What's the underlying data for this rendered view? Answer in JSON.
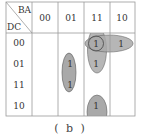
{
  "kmap": {
    "col_var": "BA",
    "row_var": "DC",
    "col_labels": [
      "00",
      "01",
      "11",
      "10"
    ],
    "row_labels": [
      "00",
      "01",
      "11",
      "10"
    ],
    "cells": [
      [
        "",
        "",
        "1",
        "1"
      ],
      [
        "",
        "1",
        "1",
        ""
      ],
      [
        "",
        "1",
        "",
        ""
      ],
      [
        "",
        "",
        "1",
        ""
      ]
    ],
    "groups": [
      {
        "name": "col11-rows00-01",
        "cells": [
          [
            0,
            2
          ],
          [
            1,
            2
          ]
        ]
      },
      {
        "name": "row00-cols11-10",
        "cells": [
          [
            0,
            2
          ],
          [
            0,
            3
          ]
        ]
      },
      {
        "name": "single-00-11",
        "cells": [
          [
            0,
            2
          ]
        ]
      },
      {
        "name": "col01-rows01-11",
        "cells": [
          [
            1,
            1
          ],
          [
            2,
            1
          ]
        ]
      },
      {
        "name": "col11-row10-wrap",
        "cells": [
          [
            3,
            2
          ]
        ]
      }
    ],
    "group_fill": "#a9a9a9",
    "grid_color": "#9a9a9a"
  },
  "caption": "( b )"
}
